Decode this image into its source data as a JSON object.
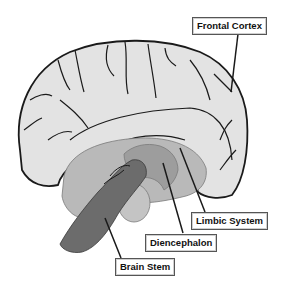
{
  "diagram": {
    "labels": {
      "frontal_cortex": "Frontal Cortex",
      "limbic_system": "Limbic System",
      "diencephalon": "Diencephalon",
      "brain_stem": "Brain Stem"
    },
    "colors": {
      "cortex": "#e3e3e3",
      "limbic": "#b9b9b9",
      "diencephalon": "#9d9d9d",
      "brain_stem": "#6c6c6c",
      "cerebellum_lobe": "#c4c4c4",
      "outline": "#1a1a1a"
    }
  }
}
